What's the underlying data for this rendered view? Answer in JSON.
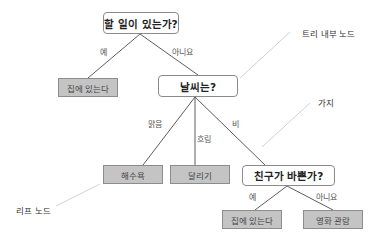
{
  "diagram": {
    "type": "decision-tree",
    "nodes": {
      "root": {
        "text": "할 일이 있는가?",
        "kind": "internal"
      },
      "leaf_stay_home_1": {
        "text": "집에 있는다",
        "kind": "leaf"
      },
      "weather": {
        "text": "날씨는?",
        "kind": "internal"
      },
      "leaf_beach": {
        "text": "해수욕",
        "kind": "leaf"
      },
      "leaf_running": {
        "text": "달리기",
        "kind": "leaf"
      },
      "friends_busy": {
        "text": "친구가 바쁜가?",
        "kind": "internal"
      },
      "leaf_stay_home_2": {
        "text": "집에 있는다",
        "kind": "leaf"
      },
      "leaf_movie": {
        "text": "영화 관람",
        "kind": "leaf"
      }
    },
    "edges": {
      "root_yes": {
        "label": "예",
        "from": "root",
        "to": "leaf_stay_home_1"
      },
      "root_no": {
        "label": "아니요",
        "from": "root",
        "to": "weather"
      },
      "weather_sunny": {
        "label": "맑음",
        "from": "weather",
        "to": "leaf_beach"
      },
      "weather_cloudy": {
        "label": "흐림",
        "from": "weather",
        "to": "leaf_running"
      },
      "weather_rain": {
        "label": "비",
        "from": "weather",
        "to": "friends_busy"
      },
      "friends_yes": {
        "label": "예",
        "from": "friends_busy",
        "to": "leaf_stay_home_2"
      },
      "friends_no": {
        "label": "아니요",
        "from": "friends_busy",
        "to": "leaf_movie"
      }
    },
    "annotations": {
      "internal_node": "트리 내부 노드",
      "branch": "가지",
      "leaf_node": "리프 노드"
    },
    "colors": {
      "leaf_fill": "#c4c4c4",
      "internal_fill": "#ffffff",
      "edge": "#4a4a4a",
      "annotation_line": "#bdbdbd"
    }
  }
}
